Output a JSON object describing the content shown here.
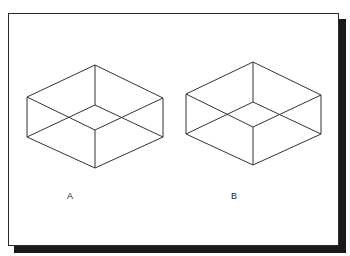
{
  "figure": {
    "stroke_color": "#333333",
    "frame_color": "#2a2a2a",
    "shadow_color": "#1a1a1a",
    "labels": [
      {
        "id": "A",
        "text": "A",
        "x": 67,
        "y": 191
      },
      {
        "id": "B",
        "text": "B",
        "x": 231,
        "y": 191
      }
    ],
    "cubes": [
      {
        "id": "A",
        "vertices": {
          "top": [
            95,
            65
          ],
          "left_top": [
            27,
            97
          ],
          "right_top": [
            163,
            98
          ],
          "inner": [
            95,
            105
          ],
          "front": [
            95,
            130
          ],
          "left_bottom": [
            27,
            137
          ],
          "right_bottom": [
            163,
            137
          ],
          "bottom": [
            95,
            168
          ]
        }
      },
      {
        "id": "B",
        "vertices": {
          "top": [
            253,
            62
          ],
          "left_top": [
            186,
            94
          ],
          "right_top": [
            321,
            95
          ],
          "inner": [
            253,
            102
          ],
          "front": [
            253,
            127
          ],
          "left_bottom": [
            186,
            134
          ],
          "right_bottom": [
            321,
            134
          ],
          "bottom": [
            253,
            165
          ]
        }
      }
    ]
  }
}
